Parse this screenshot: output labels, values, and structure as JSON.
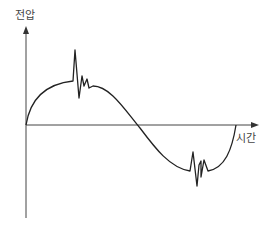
{
  "diagram": {
    "y_axis_label": "전압",
    "x_axis_label": "시간",
    "line_color": "#222222"
  }
}
